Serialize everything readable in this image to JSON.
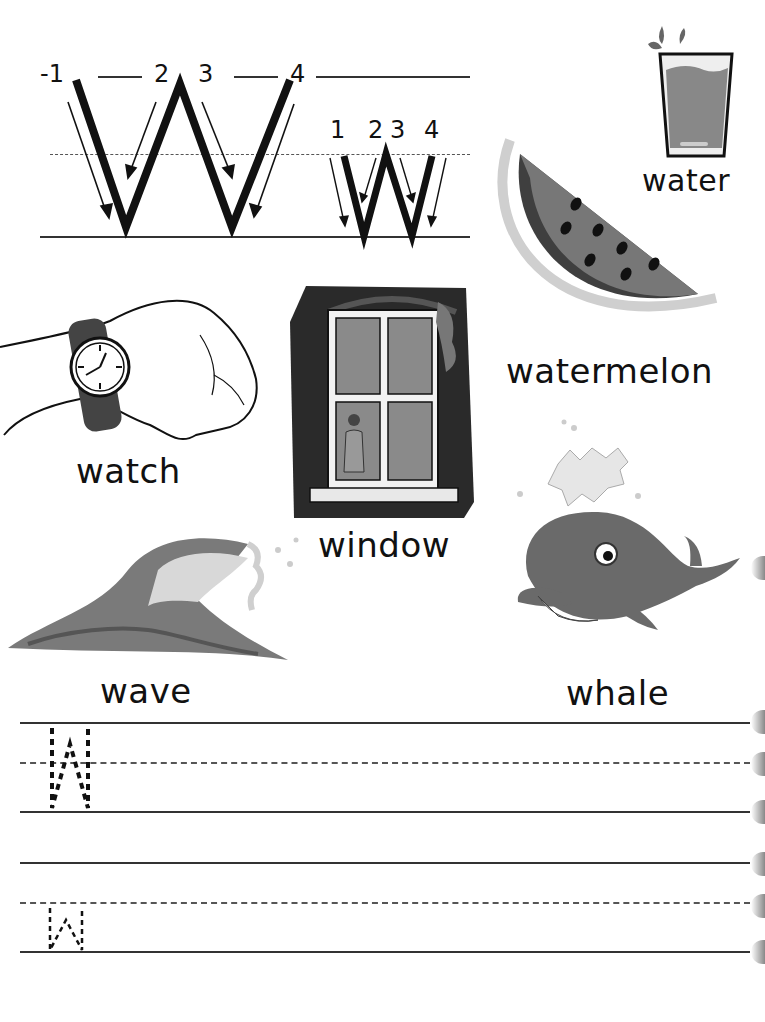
{
  "worksheet": {
    "letter_upper": "W",
    "letter_lower": "w",
    "stroke_numbers_upper": [
      "-1",
      "2",
      "3",
      "4"
    ],
    "stroke_numbers_lower": [
      "1",
      "2",
      "3",
      "4"
    ]
  },
  "pictures": [
    {
      "label": "water",
      "icon": "glass-of-water-icon"
    },
    {
      "label": "watermelon",
      "icon": "watermelon-slice-icon"
    },
    {
      "label": "watch",
      "icon": "wristwatch-icon"
    },
    {
      "label": "window",
      "icon": "window-icon"
    },
    {
      "label": "wave",
      "icon": "ocean-wave-icon"
    },
    {
      "label": "whale",
      "icon": "whale-icon"
    }
  ],
  "practice": {
    "row1_trace_letter": "W",
    "row2_trace_letter": "w"
  },
  "colors": {
    "ink": "#111111",
    "fill_gray": "#7a7a7a",
    "dark_gray": "#3a3a3a",
    "light_gray": "#cfcfcf"
  }
}
